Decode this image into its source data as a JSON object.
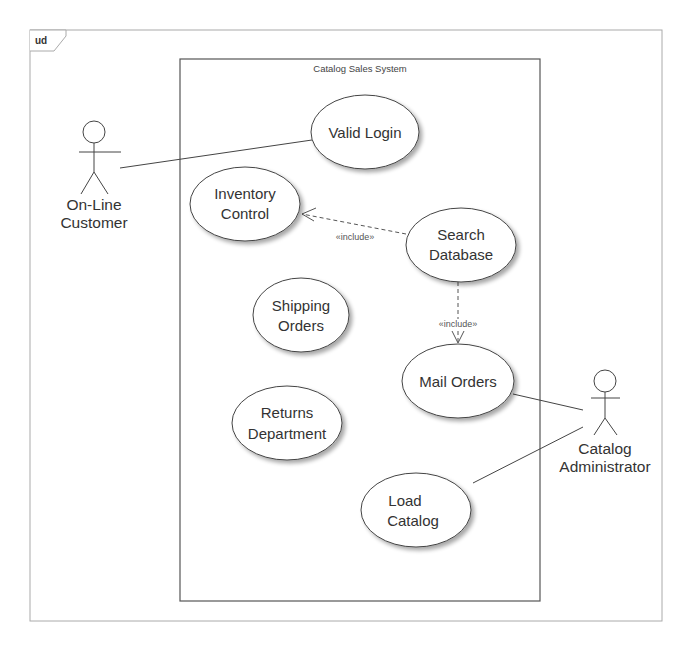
{
  "diagram": {
    "frame": {
      "tag": "ud"
    },
    "system": {
      "title": "Catalog Sales System"
    },
    "actors": [
      {
        "id": "customer",
        "line1": "On-Line",
        "line2": "Customer"
      },
      {
        "id": "admin",
        "line1": "Catalog",
        "line2": "Administrator"
      }
    ],
    "use_cases": [
      {
        "id": "valid_login",
        "line1": "Valid Login",
        "line2": ""
      },
      {
        "id": "inventory_control",
        "line1": "Inventory",
        "line2": "Control"
      },
      {
        "id": "search_database",
        "line1": "Search",
        "line2": "Database"
      },
      {
        "id": "shipping_orders",
        "line1": "Shipping",
        "line2": "Orders"
      },
      {
        "id": "mail_orders",
        "line1": "Mail Orders",
        "line2": ""
      },
      {
        "id": "returns_department",
        "line1": "Returns",
        "line2": "Department"
      },
      {
        "id": "load_catalog",
        "line1": "Load",
        "line2": "Catalog"
      }
    ],
    "relations": [
      {
        "type": "association",
        "from": "customer",
        "to": "valid_login"
      },
      {
        "type": "include",
        "from": "search_database",
        "to": "inventory_control",
        "label": "«include»"
      },
      {
        "type": "include",
        "from": "search_database",
        "to": "mail_orders",
        "label": "«include»"
      },
      {
        "type": "association",
        "from": "admin",
        "to": "mail_orders"
      },
      {
        "type": "association",
        "from": "admin",
        "to": "load_catalog"
      }
    ],
    "colors": {
      "line": "#444444",
      "frame": "#999999",
      "ellipse_fill": "#ffffff",
      "text": "#333333"
    }
  }
}
